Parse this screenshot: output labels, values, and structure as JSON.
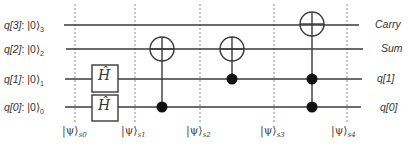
{
  "diagram": {
    "type": "quantum-circuit",
    "qubits": [
      {
        "id": "q3",
        "label_reg": "q[3]",
        "label_ket": "|0⟩",
        "label_sub": "3",
        "output_label": "Carry",
        "y": 25
      },
      {
        "id": "q2",
        "label_reg": "q[2]",
        "label_ket": "|0⟩",
        "label_sub": "2",
        "output_label": "Sum",
        "y": 49
      },
      {
        "id": "q1",
        "label_reg": "q[1]",
        "label_ket": "|0⟩",
        "label_sub": "1",
        "output_label": "q[1]",
        "y": 79
      },
      {
        "id": "q0",
        "label_reg": "q[0]",
        "label_ket": "|0⟩",
        "label_sub": "0",
        "output_label": "q[0]",
        "y": 107
      }
    ],
    "gates": [
      {
        "type": "H",
        "label": "Ĥ",
        "target": "q1",
        "x": 105
      },
      {
        "type": "H",
        "label": "Ĥ",
        "target": "q0",
        "x": 105
      },
      {
        "type": "CNOT",
        "controls": [
          "q0"
        ],
        "target": "q2",
        "x": 162
      },
      {
        "type": "CNOT",
        "controls": [
          "q1"
        ],
        "target": "q2",
        "x": 232
      },
      {
        "type": "Toffoli",
        "controls": [
          "q1",
          "q0"
        ],
        "target": "q3",
        "x": 312
      }
    ],
    "state_markers": [
      {
        "label": "|ψ⟩",
        "sub": "s0",
        "x": 75
      },
      {
        "label": "|ψ⟩",
        "sub": "s1",
        "x": 135
      },
      {
        "label": "|ψ⟩",
        "sub": "s2",
        "x": 200
      },
      {
        "label": "|ψ⟩",
        "sub": "s3",
        "x": 274
      },
      {
        "label": "|ψ⟩",
        "sub": "s4",
        "x": 347
      }
    ],
    "colors": {
      "wire": "#3a3a3a",
      "dashed": "#888888",
      "text": "#333333",
      "background": "#ffffff"
    }
  },
  "labels": {
    "q3": {
      "reg": "q[3]",
      "ket": ": |0⟩",
      "sub": "3"
    },
    "q2": {
      "reg": "q[2]",
      "ket": ": |0⟩",
      "sub": "2"
    },
    "q1": {
      "reg": "q[1]",
      "ket": ": |0⟩",
      "sub": "1"
    },
    "q0": {
      "reg": "q[0]",
      "ket": ": |0⟩",
      "sub": "0"
    },
    "out_q3": "Carry",
    "out_q2": "Sum",
    "out_q1": "q[1]",
    "out_q0": "q[0]",
    "hadamard": "Ĥ",
    "psi": "|ψ⟩",
    "psi_subs": [
      "s0",
      "s1",
      "s2",
      "s3",
      "s4"
    ]
  }
}
